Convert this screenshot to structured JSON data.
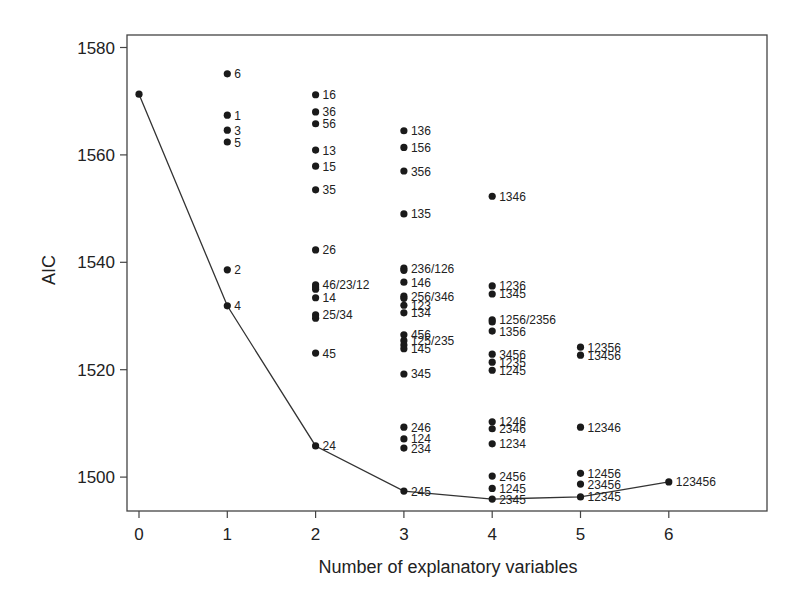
{
  "chart_data": {
    "type": "scatter",
    "title": "",
    "xlabel": "Number of explanatory variables",
    "ylabel": "AIC",
    "xlim": [
      -0.1,
      7.2
    ],
    "ylim": [
      1494,
      1582
    ],
    "xticks": [
      0,
      1,
      2,
      3,
      4,
      5,
      6
    ],
    "yticks": [
      1500,
      1520,
      1540,
      1560,
      1580
    ],
    "grid": false,
    "legend": null,
    "points": [
      {
        "x": 0,
        "y": 1571.3,
        "label": ""
      },
      {
        "x": 1,
        "y": 1575.1,
        "label": "6"
      },
      {
        "x": 1,
        "y": 1567.4,
        "label": "1"
      },
      {
        "x": 1,
        "y": 1564.6,
        "label": "3"
      },
      {
        "x": 1,
        "y": 1562.4,
        "label": "5"
      },
      {
        "x": 1,
        "y": 1538.6,
        "label": "2"
      },
      {
        "x": 1,
        "y": 1531.9,
        "label": "4"
      },
      {
        "x": 2,
        "y": 1571.2,
        "label": "16"
      },
      {
        "x": 2,
        "y": 1568.0,
        "label": "36"
      },
      {
        "x": 2,
        "y": 1565.8,
        "label": "56"
      },
      {
        "x": 2,
        "y": 1560.9,
        "label": "13"
      },
      {
        "x": 2,
        "y": 1557.9,
        "label": "15"
      },
      {
        "x": 2,
        "y": 1553.5,
        "label": "35"
      },
      {
        "x": 2,
        "y": 1542.3,
        "label": "26"
      },
      {
        "x": 2,
        "y": 1535.8,
        "label": "46/23/12"
      },
      {
        "x": 2,
        "y": 1535.4,
        "label": ""
      },
      {
        "x": 2,
        "y": 1535.0,
        "label": ""
      },
      {
        "x": 2,
        "y": 1533.4,
        "label": "14"
      },
      {
        "x": 2,
        "y": 1530.2,
        "label": "25/34"
      },
      {
        "x": 2,
        "y": 1529.6,
        "label": ""
      },
      {
        "x": 2,
        "y": 1523.1,
        "label": "45"
      },
      {
        "x": 2,
        "y": 1505.8,
        "label": "24"
      },
      {
        "x": 3,
        "y": 1564.5,
        "label": "136"
      },
      {
        "x": 3,
        "y": 1561.4,
        "label": "156"
      },
      {
        "x": 3,
        "y": 1557.0,
        "label": "356"
      },
      {
        "x": 3,
        "y": 1549.0,
        "label": "135"
      },
      {
        "x": 3,
        "y": 1538.9,
        "label": "236/126"
      },
      {
        "x": 3,
        "y": 1538.5,
        "label": ""
      },
      {
        "x": 3,
        "y": 1536.3,
        "label": "146"
      },
      {
        "x": 3,
        "y": 1533.7,
        "label": "256/346"
      },
      {
        "x": 3,
        "y": 1533.3,
        "label": ""
      },
      {
        "x": 3,
        "y": 1532.0,
        "label": "123"
      },
      {
        "x": 3,
        "y": 1530.6,
        "label": "134"
      },
      {
        "x": 3,
        "y": 1526.5,
        "label": "456"
      },
      {
        "x": 3,
        "y": 1525.4,
        "label": "125/235"
      },
      {
        "x": 3,
        "y": 1524.6,
        "label": ""
      },
      {
        "x": 3,
        "y": 1523.9,
        "label": "145"
      },
      {
        "x": 3,
        "y": 1519.2,
        "label": "345"
      },
      {
        "x": 3,
        "y": 1509.3,
        "label": "246"
      },
      {
        "x": 3,
        "y": 1507.1,
        "label": "124"
      },
      {
        "x": 3,
        "y": 1505.4,
        "label": "234"
      },
      {
        "x": 3,
        "y": 1497.4,
        "label": "245"
      },
      {
        "x": 4,
        "y": 1552.3,
        "label": "1346"
      },
      {
        "x": 4,
        "y": 1535.6,
        "label": "1236"
      },
      {
        "x": 4,
        "y": 1534.1,
        "label": "1345"
      },
      {
        "x": 4,
        "y": 1529.3,
        "label": "1256/2356"
      },
      {
        "x": 4,
        "y": 1528.9,
        "label": ""
      },
      {
        "x": 4,
        "y": 1527.2,
        "label": "1356"
      },
      {
        "x": 4,
        "y": 1522.9,
        "label": "3456"
      },
      {
        "x": 4,
        "y": 1521.4,
        "label": "1235"
      },
      {
        "x": 4,
        "y": 1519.9,
        "label": "1245"
      },
      {
        "x": 4,
        "y": 1510.3,
        "label": "1246"
      },
      {
        "x": 4,
        "y": 1509.0,
        "label": "2346"
      },
      {
        "x": 4,
        "y": 1506.2,
        "label": "1234"
      },
      {
        "x": 4,
        "y": 1500.2,
        "label": "2456"
      },
      {
        "x": 4,
        "y": 1497.9,
        "label": "1245"
      },
      {
        "x": 4,
        "y": 1495.9,
        "label": "2345"
      },
      {
        "x": 5,
        "y": 1524.2,
        "label": "12356"
      },
      {
        "x": 5,
        "y": 1522.7,
        "label": "13456"
      },
      {
        "x": 5,
        "y": 1509.3,
        "label": "12346"
      },
      {
        "x": 5,
        "y": 1500.7,
        "label": "12456"
      },
      {
        "x": 5,
        "y": 1498.7,
        "label": "23456"
      },
      {
        "x": 5,
        "y": 1496.3,
        "label": "12345"
      },
      {
        "x": 6,
        "y": 1499.1,
        "label": "123456"
      }
    ],
    "min_aic_path": {
      "x": [
        0,
        1,
        2,
        3,
        4,
        5,
        6
      ],
      "y": [
        1571.3,
        1531.9,
        1505.8,
        1497.4,
        1495.9,
        1496.3,
        1499.1
      ],
      "labels": [
        "",
        "4",
        "24",
        "245",
        "2345",
        "12345",
        "123456"
      ]
    }
  },
  "colors": {
    "ink": "#1a1a1a",
    "axis": "#444444",
    "background": "#ffffff"
  }
}
